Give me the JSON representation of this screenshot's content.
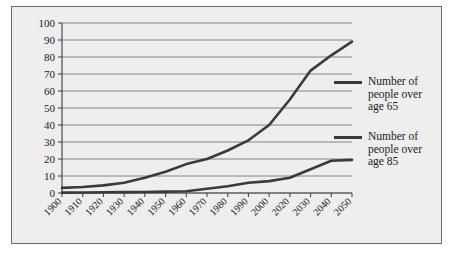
{
  "chart_data": {
    "type": "line",
    "title": "",
    "xlabel": "",
    "ylabel": "",
    "ylim": [
      0,
      100
    ],
    "ytick_step": 10,
    "grid": true,
    "legend_position": "right",
    "categories": [
      "1900",
      "1910",
      "1920",
      "1930",
      "1940",
      "1950",
      "1960",
      "1970",
      "1980",
      "1990",
      "2000",
      "2020",
      "2030",
      "2040",
      "2050"
    ],
    "yticks": [
      "0",
      "10",
      "20",
      "30",
      "40",
      "50",
      "60",
      "70",
      "80",
      "90",
      "100"
    ],
    "series": [
      {
        "name": "Number of people over age 65",
        "values": [
          3,
          3.5,
          4.5,
          6,
          9,
          12.5,
          17,
          20,
          25,
          31,
          40,
          55,
          72,
          81,
          89
        ],
        "color": "#3a3a3a"
      },
      {
        "name": "Number of people over age 85",
        "values": [
          0.2,
          0.3,
          0.4,
          0.5,
          0.6,
          0.8,
          1,
          2.5,
          4,
          6,
          7,
          9,
          14,
          19,
          19.5
        ],
        "color": "#3a3a3a"
      }
    ]
  },
  "legend": {
    "entries": [
      {
        "label": "Number of\npeople over\nage 65"
      },
      {
        "label": "Number of\npeople over\nage 85"
      }
    ]
  }
}
